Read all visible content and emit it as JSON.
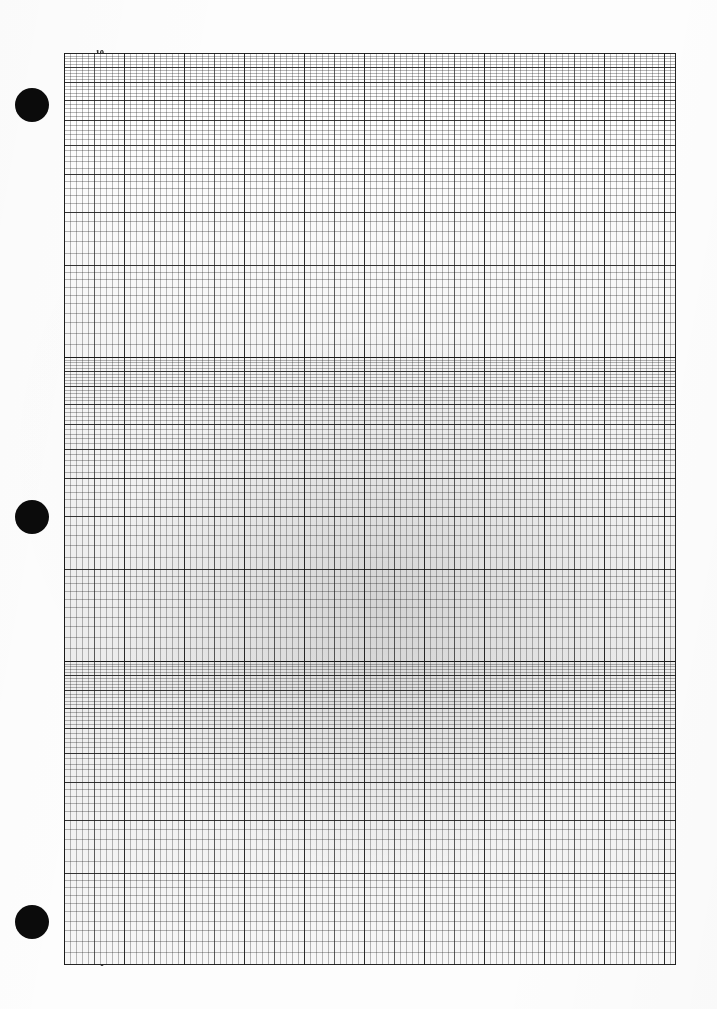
{
  "sheet": {
    "title": "Semi-Logarithmic Graph Paper",
    "description": "Three-cycle semi-log graph paper sheet, scanned",
    "width": 717,
    "height": 1009,
    "paper_color": "#fdfdfd",
    "ink_color": "#111111"
  },
  "punch_holes": [
    {
      "name": "punch-hole-top",
      "cx": 32,
      "cy": 105,
      "r": 17
    },
    {
      "name": "punch-hole-middle",
      "cx": 32,
      "cy": 517,
      "r": 17
    },
    {
      "name": "punch-hole-bottom",
      "cx": 32,
      "cy": 922,
      "r": 17
    }
  ],
  "plot": {
    "left": 64,
    "top": 53,
    "right": 676,
    "bottom": 965,
    "width": 612,
    "height": 912
  },
  "y_axis": {
    "type": "logarithmic",
    "cycles": 3,
    "decade_height_px": 304,
    "label_color": "#0d0d0d",
    "top_value": "10",
    "bottom_value": "1",
    "ticks": [
      {
        "label": "10",
        "y": 53,
        "decade": 1,
        "mantissa": 10,
        "leader": 108,
        "hidden": false
      },
      {
        "label": "9",
        "y": 70,
        "decade": 1,
        "mantissa": 9,
        "leader": 108,
        "hidden": false
      },
      {
        "label": "8",
        "y": 89,
        "decade": 1,
        "mantissa": 8,
        "leader": 108,
        "hidden": false
      },
      {
        "label": "7",
        "y": 110,
        "decade": 1,
        "mantissa": 7,
        "leader": 108,
        "hidden": true
      },
      {
        "label": "6",
        "y": 135,
        "decade": 1,
        "mantissa": 6,
        "leader": 108,
        "hidden": false
      },
      {
        "label": "5",
        "y": 165,
        "decade": 1,
        "mantissa": 5,
        "leader": 108,
        "hidden": false
      },
      {
        "label": "4",
        "y": 200,
        "decade": 1,
        "mantissa": 4,
        "leader": 108,
        "hidden": false
      },
      {
        "label": "3",
        "y": 212,
        "decade": 1,
        "mantissa": 3,
        "leader": 108,
        "hidden": false
      },
      {
        "label": "2",
        "y": 265,
        "decade": 1,
        "mantissa": 2,
        "leader": 108,
        "hidden": false
      },
      {
        "label": "1",
        "y": 357,
        "decade": 2,
        "mantissa": 10,
        "leader": 108,
        "hidden": false
      },
      {
        "label": "9",
        "y": 372,
        "decade": 2,
        "mantissa": 9,
        "leader": 108,
        "hidden": false
      },
      {
        "label": "8",
        "y": 388,
        "decade": 2,
        "mantissa": 8,
        "leader": 108,
        "hidden": false
      },
      {
        "label": "7",
        "y": 404,
        "decade": 2,
        "mantissa": 7,
        "leader": 108,
        "hidden": false
      },
      {
        "label": "6",
        "y": 425,
        "decade": 2,
        "mantissa": 6,
        "leader": 108,
        "hidden": false
      },
      {
        "label": "5",
        "y": 448,
        "decade": 2,
        "mantissa": 5,
        "leader": 108,
        "hidden": false
      },
      {
        "label": "4",
        "y": 478,
        "decade": 2,
        "mantissa": 4,
        "leader": 108,
        "hidden": false
      },
      {
        "label": "3",
        "y": 517,
        "decade": 2,
        "mantissa": 3,
        "leader": 108,
        "hidden": false
      },
      {
        "label": "2",
        "y": 570,
        "decade": 2,
        "mantissa": 2,
        "leader": 108,
        "hidden": false
      },
      {
        "label": "1",
        "y": 660,
        "decade": 3,
        "mantissa": 10,
        "leader": 108,
        "hidden": false
      },
      {
        "label": "9",
        "y": 675,
        "decade": 3,
        "mantissa": 9,
        "leader": 108,
        "hidden": false
      },
      {
        "label": "8",
        "y": 692,
        "decade": 3,
        "mantissa": 8,
        "leader": 108,
        "hidden": false
      },
      {
        "label": "7",
        "y": 708,
        "decade": 3,
        "mantissa": 7,
        "leader": 108,
        "hidden": false
      },
      {
        "label": "6",
        "y": 727,
        "decade": 3,
        "mantissa": 6,
        "leader": 108,
        "hidden": false
      },
      {
        "label": "5",
        "y": 750,
        "decade": 3,
        "mantissa": 5,
        "leader": 108,
        "hidden": false
      },
      {
        "label": "4",
        "y": 780,
        "decade": 3,
        "mantissa": 4,
        "leader": 108,
        "hidden": false
      },
      {
        "label": "3",
        "y": 818,
        "decade": 3,
        "mantissa": 3,
        "leader": 108,
        "hidden": false
      },
      {
        "label": "2",
        "y": 872,
        "decade": 3,
        "mantissa": 2,
        "leader": 108,
        "hidden": false
      },
      {
        "label": "1",
        "y": 963,
        "decade": 4,
        "mantissa": 10,
        "leader": 108,
        "hidden": false
      }
    ]
  },
  "x_axis": {
    "type": "linear",
    "minor_spacing_px": 6,
    "medium_spacing_px": 30,
    "major_spacing_px": 60,
    "divisions": 102
  },
  "chart_data": {
    "type": "grid",
    "xlabel": "",
    "ylabel": "",
    "grid": true,
    "legend": "none",
    "y_scale": "log",
    "x_scale": "linear",
    "y_cycles": 3,
    "y_tick_labels": [
      "10",
      "9",
      "8",
      "7",
      "6",
      "5",
      "4",
      "3",
      "2",
      "1",
      "9",
      "8",
      "7",
      "6",
      "5",
      "4",
      "3",
      "2",
      "1",
      "9",
      "8",
      "7",
      "6",
      "5",
      "4",
      "3",
      "2",
      "1"
    ],
    "series": [],
    "values": [],
    "categories": []
  }
}
